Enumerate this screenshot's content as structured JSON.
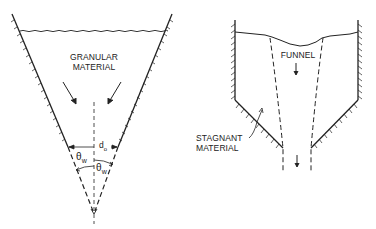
{
  "diagrams": [
    {
      "name": "mass-flow-hopper",
      "labels": {
        "material_line1": "GRANULAR",
        "material_line2": "MATERIAL",
        "outlet_diameter": "d",
        "outlet_diameter_sub": "o",
        "wall_angle_left": "θ",
        "wall_angle_left_sub": "w",
        "wall_angle_right": "θ",
        "wall_angle_right_sub": "w"
      }
    },
    {
      "name": "funnel-flow-hopper",
      "labels": {
        "funnel": "FUNNEL",
        "stagnant_line1": "STAGNANT",
        "stagnant_line2": "MATERIAL"
      }
    }
  ],
  "colors": {
    "line": "#222222",
    "background": "#ffffff"
  }
}
